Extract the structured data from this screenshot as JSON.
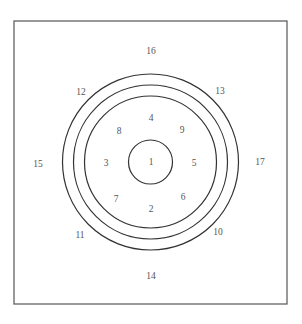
{
  "diagram": {
    "frame": {
      "x": 14,
      "y": 21,
      "width": 273,
      "height": 283,
      "stroke": "#555555"
    },
    "center": {
      "x": 150.5,
      "y": 162
    },
    "circles": [
      {
        "id": "core",
        "r": 22
      },
      {
        "id": "ring-inner",
        "r": 66
      },
      {
        "id": "ring-middle",
        "r": 77
      },
      {
        "id": "ring-outer",
        "r": 88
      }
    ],
    "line_color": "#333333",
    "text_color": "#555555",
    "labels": [
      {
        "id": "1",
        "text": "1",
        "x": 151,
        "y": 165
      },
      {
        "id": "2",
        "text": "2",
        "x": 151,
        "y": 212
      },
      {
        "id": "3",
        "text": "3",
        "x": 106,
        "y": 166
      },
      {
        "id": "4",
        "text": "4",
        "x": 151,
        "y": 121
      },
      {
        "id": "5",
        "text": "5",
        "x": 194,
        "y": 166
      },
      {
        "id": "6",
        "text": "6",
        "x": 183,
        "y": 200
      },
      {
        "id": "7",
        "text": "7",
        "x": 116,
        "y": 202
      },
      {
        "id": "8",
        "text": "8",
        "x": 119,
        "y": 134
      },
      {
        "id": "9",
        "text": "9",
        "x": 182,
        "y": 133
      },
      {
        "id": "10",
        "text": "10",
        "x": 218,
        "y": 235
      },
      {
        "id": "11",
        "text": "11",
        "x": 80,
        "y": 238
      },
      {
        "id": "12",
        "text": "12",
        "x": 81,
        "y": 95
      },
      {
        "id": "13",
        "text": "13",
        "x": 220,
        "y": 94
      },
      {
        "id": "14",
        "text": "14",
        "x": 151,
        "y": 279
      },
      {
        "id": "15",
        "text": "15",
        "x": 38,
        "y": 167
      },
      {
        "id": "16",
        "text": "16",
        "x": 151,
        "y": 54
      },
      {
        "id": "17",
        "text": "17",
        "x": 260,
        "y": 165
      }
    ]
  }
}
